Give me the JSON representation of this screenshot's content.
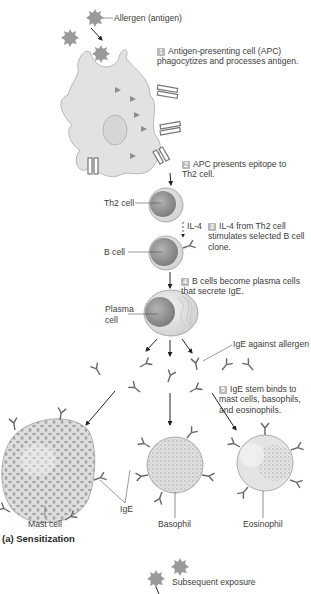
{
  "figure": {
    "caption": "(a) Sensitization",
    "labels": {
      "allergen": "Allergen (antigen)",
      "th2_cell": "Th2 cell",
      "il4": "IL-4",
      "b_cell": "B cell",
      "plasma_cell_line1": "Plasma",
      "plasma_cell_line2": "cell",
      "ige_against_allergen": "IgE against allergen",
      "ige": "IgE",
      "mast_cell": "Mast cell",
      "basophil": "Basophil",
      "eosinophil": "Eosinophil",
      "subsequent_exposure": "Subsequent exposure"
    },
    "steps": [
      {
        "number": "1",
        "text": "Antigen-presenting cell (APC) phagocytizes and processes antigen."
      },
      {
        "number": "2",
        "text": "APC presents epitope to Th2 cell."
      },
      {
        "number": "3",
        "text": "IL-4 from Th2 cell stimulates selected B cell clone."
      },
      {
        "number": "4",
        "text": "B cells become plasma cells that secrete IgE."
      },
      {
        "number": "5",
        "text": "IgE stem binds to mast cells, basophils, and eosinophils."
      }
    ],
    "colors": {
      "cell_fill": "#e4e4e4",
      "cell_outline": "#9a9a9a",
      "nucleus": "#9c9c9c",
      "granule": "#9e9e9e",
      "step_badge": "#b8b8b8",
      "arrow": "#222222"
    }
  }
}
